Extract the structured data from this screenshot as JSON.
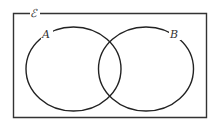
{
  "diagram": {
    "type": "venn",
    "universal_set": {
      "label": "ℰ"
    },
    "sets": [
      {
        "label": "A"
      },
      {
        "label": "B"
      }
    ],
    "colors": {
      "stroke": "#222222",
      "frame": "#333333",
      "background": "#ffffff"
    }
  }
}
